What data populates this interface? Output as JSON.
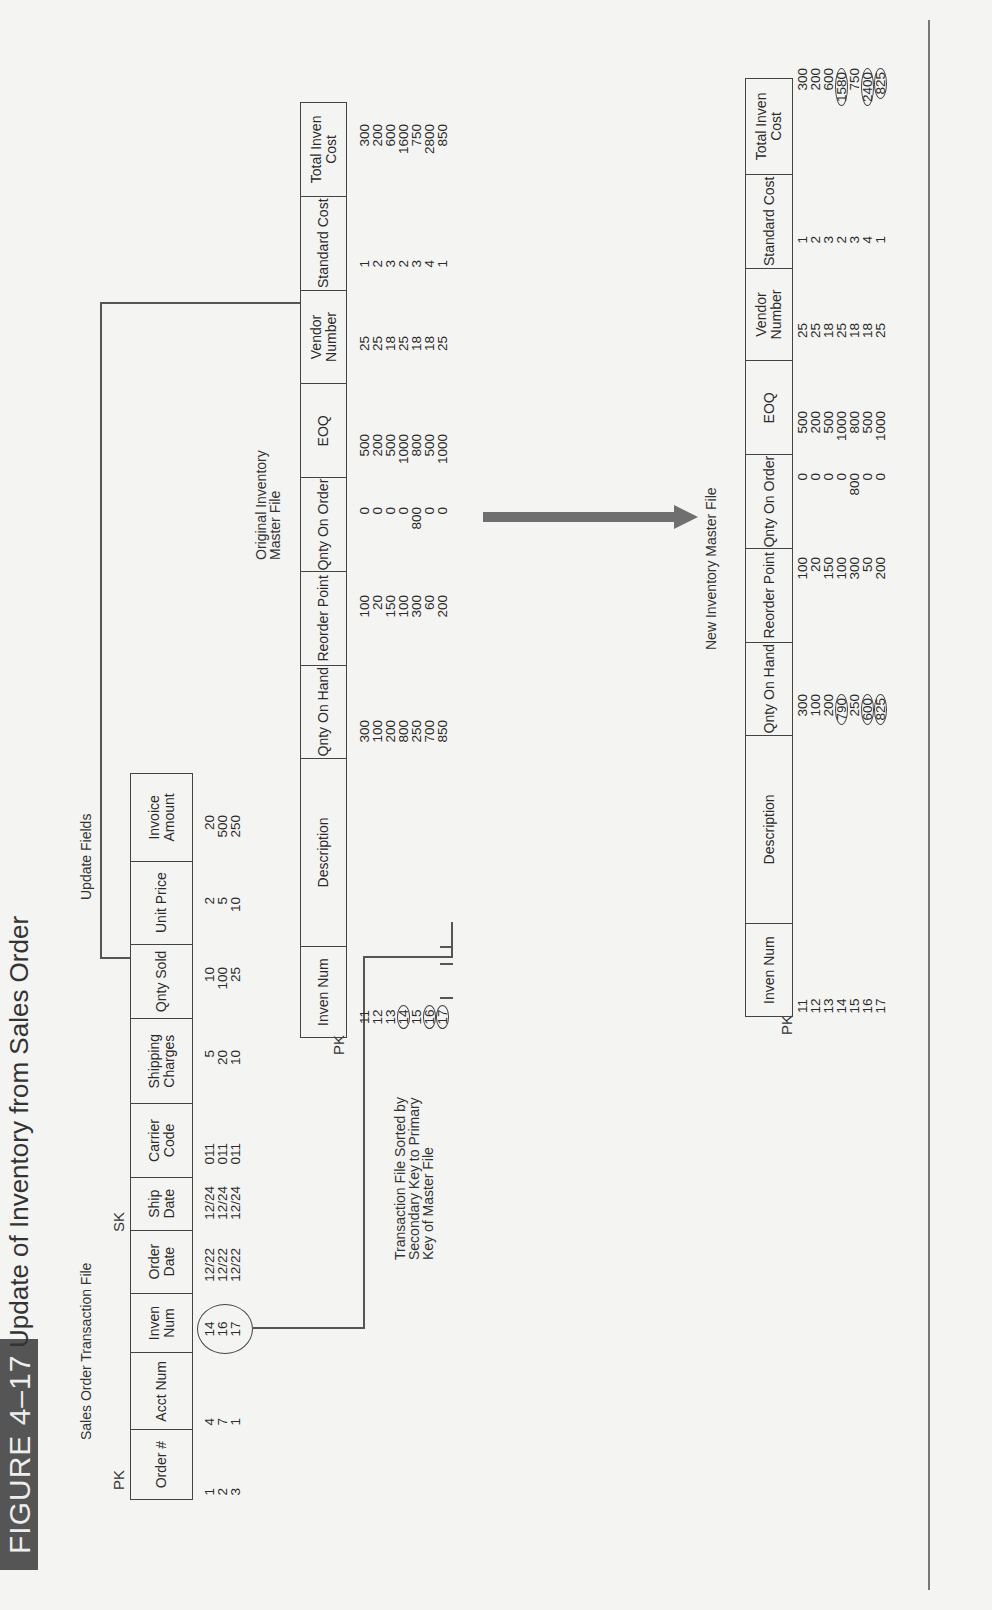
{
  "figure": {
    "badge": "FIGURE 4–17",
    "title": "Update of Inventory from Sales Order"
  },
  "sales_order_file": {
    "title": "Sales Order Transaction File",
    "pk_label": "PK",
    "sk_label": "SK",
    "update_fields_label": "Update Fields",
    "columns": [
      {
        "label": "Order #",
        "values": [
          "1",
          "2",
          "3"
        ]
      },
      {
        "label": "Acct Num",
        "values": [
          "4",
          "7",
          "1"
        ]
      },
      {
        "label": "Inven Num",
        "values": [
          "14",
          "16",
          "17"
        ]
      },
      {
        "label": "Order Date",
        "values": [
          "12/22",
          "12/22",
          "12/22"
        ]
      },
      {
        "label": "Ship Date",
        "values": [
          "12/24",
          "12/24",
          "12/24"
        ]
      },
      {
        "label": "Carrier Code",
        "values": [
          "011",
          "011",
          "011"
        ]
      },
      {
        "label": "Shipping Charges",
        "values": [
          "5",
          "20",
          "10"
        ]
      },
      {
        "label": "Qnty Sold",
        "values": [
          "10",
          "100",
          "25"
        ]
      },
      {
        "label": "Unit Price",
        "values": [
          "2",
          "5",
          "10"
        ]
      },
      {
        "label": "Invoice Amount",
        "values": [
          "20",
          "500",
          "250"
        ]
      }
    ]
  },
  "sort_note": {
    "line1": "Transaction File Sorted by",
    "line2": "Secondary Key to Primary",
    "line3": "Key of Master File"
  },
  "original_master": {
    "title_line1": "Original Inventory",
    "title_line2": "Master File",
    "pk_label": "PK",
    "columns": [
      {
        "label": "Inven Num",
        "values": [
          "11",
          "12",
          "13",
          "14",
          "15",
          "16",
          "17"
        ],
        "highlight": [
          3,
          5,
          6
        ]
      },
      {
        "label": "Description",
        "values": []
      },
      {
        "label": "Qnty On Hand",
        "values": [
          "300",
          "100",
          "200",
          "800",
          "250",
          "700",
          "850"
        ]
      },
      {
        "label": "Reorder Point",
        "values": [
          "100",
          "20",
          "150",
          "100",
          "300",
          "60",
          "200"
        ]
      },
      {
        "label": "Qnty On Order",
        "values": [
          "0",
          "0",
          "0",
          "0",
          "800",
          "0",
          "0"
        ]
      },
      {
        "label": "EOQ",
        "values": [
          "500",
          "200",
          "500",
          "1000",
          "800",
          "500",
          "1000"
        ]
      },
      {
        "label": "Vendor Number",
        "values": [
          "25",
          "25",
          "18",
          "25",
          "18",
          "18",
          "25"
        ]
      },
      {
        "label": "Standard Cost",
        "values": [
          "1",
          "2",
          "3",
          "2",
          "3",
          "4",
          "1"
        ]
      },
      {
        "label": "Total Inven Cost",
        "values": [
          "300",
          "200",
          "600",
          "1600",
          "750",
          "2800",
          "850"
        ]
      }
    ]
  },
  "new_master": {
    "title": "New Inventory Master File",
    "pk_label": "PK",
    "columns": [
      {
        "label": "Inven Num",
        "values": [
          "11",
          "12",
          "13",
          "14",
          "15",
          "16",
          "17"
        ]
      },
      {
        "label": "Description",
        "values": []
      },
      {
        "label": "Qnty On Hand",
        "values": [
          "300",
          "100",
          "200",
          "790",
          "250",
          "600",
          "825"
        ],
        "highlight": [
          3,
          5,
          6
        ]
      },
      {
        "label": "Reorder Point",
        "values": [
          "100",
          "20",
          "150",
          "100",
          "300",
          "50",
          "200"
        ]
      },
      {
        "label": "Qnty On Order",
        "values": [
          "0",
          "0",
          "0",
          "0",
          "800",
          "0",
          "0"
        ]
      },
      {
        "label": "EOQ",
        "values": [
          "500",
          "200",
          "500",
          "1000",
          "800",
          "500",
          "1000"
        ]
      },
      {
        "label": "Vendor Number",
        "values": [
          "25",
          "25",
          "18",
          "25",
          "18",
          "18",
          "25"
        ]
      },
      {
        "label": "Standard Cost",
        "values": [
          "1",
          "2",
          "3",
          "2",
          "3",
          "4",
          "1"
        ]
      },
      {
        "label": "Total Inven Cost",
        "values": [
          "300",
          "200",
          "600",
          "1580",
          "750",
          "2400",
          "825"
        ],
        "highlight": [
          3,
          5,
          6
        ]
      }
    ]
  },
  "colors": {
    "badge_bg": "#555555",
    "arrow": "#6f6f6f",
    "ink": "#2a2a2a",
    "paper": "#f4f4f2"
  }
}
